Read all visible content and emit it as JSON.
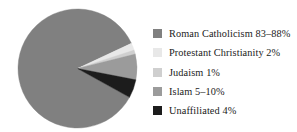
{
  "chart_data": {
    "type": "pie",
    "title": "",
    "subtitle": "",
    "xlabel": "",
    "ylabel": "",
    "legend_position": "right",
    "grid": false,
    "categories": [
      "Roman Catholicism",
      "Protestant Christianity",
      "Judaism",
      "Islam",
      "Unaffiliated"
    ],
    "values": [
      85,
      2,
      1,
      7,
      4
    ],
    "value_labels": [
      "83–88%",
      "2%",
      "1%",
      "5–10%",
      "4%"
    ],
    "colors": [
      "#808080",
      "#e8e8e8",
      "#cfcfcf",
      "#9b9b9b",
      "#1c1c1c"
    ],
    "slices": [
      {
        "name": "Roman Catholicism",
        "label": "Roman Catholicism 83–88%",
        "value": 85,
        "value_label": "83–88%",
        "color": "#808080",
        "start_angle": 25,
        "end_angle": 331
      },
      {
        "name": "Protestant Christianity",
        "label": "Protestant Christianity 2%",
        "value": 2,
        "value_label": "2%",
        "color": "#e8e8e8",
        "start_angle": 18,
        "end_angle": 25
      },
      {
        "name": "Judaism",
        "label": "Judaism 1%",
        "value": 1,
        "value_label": "1%",
        "color": "#cfcfcf",
        "start_angle": 14,
        "end_angle": 18
      },
      {
        "name": "Islam",
        "label": "Islam 5–10%",
        "value": 7,
        "value_label": "5–10%",
        "color": "#9b9b9b",
        "start_angle": 349,
        "end_angle": 14
      },
      {
        "name": "Unaffiliated",
        "label": "Unaffiliated 4%",
        "value": 4,
        "value_label": "4%",
        "color": "#1c1c1c",
        "start_angle": 331,
        "end_angle": 349
      }
    ]
  },
  "legend": {
    "items": [
      {
        "label": "Roman Catholicism 83–88%",
        "color": "#808080"
      },
      {
        "label": "Protestant Christianity 2%",
        "color": "#e8e8e8"
      },
      {
        "label": "Judaism 1%",
        "color": "#cfcfcf"
      },
      {
        "label": "Islam 5–10%",
        "color": "#9b9b9b"
      },
      {
        "label": "Unaffiliated 4%",
        "color": "#1c1c1c"
      }
    ]
  }
}
